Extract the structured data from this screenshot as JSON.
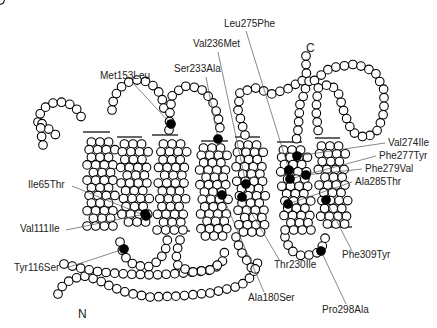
{
  "diagram": {
    "type": "receptor-snake-plot",
    "terminals": {
      "n": "N",
      "c": "C"
    },
    "colors": {
      "residue_fill": "#ffffff",
      "mutation_fill": "#000000",
      "stroke": "#000000"
    },
    "mutations": [
      {
        "id": "ile65thr",
        "label": "Ile65Thr",
        "dot": [
          146,
          216
        ],
        "text": [
          28,
          188
        ],
        "anchor": "start",
        "end": [
          72,
          186
        ]
      },
      {
        "id": "val111ile",
        "label": "Val111Ile",
        "dot": [
          145,
          214
        ],
        "text": [
          20,
          232
        ],
        "anchor": "start",
        "end": [
          66,
          230
        ]
      },
      {
        "id": "tyr116ser",
        "label": "Tyr116Ser",
        "dot": [
          124,
          249
        ],
        "text": [
          14,
          271
        ],
        "anchor": "start",
        "end": [
          66,
          268
        ]
      },
      {
        "id": "met153leu",
        "label": "Met153Leu",
        "dot": [
          171,
          124
        ],
        "text": [
          100,
          79
        ],
        "anchor": "start",
        "end": [
          132,
          82
        ]
      },
      {
        "id": "ser233ala",
        "label": "Ser233Ala",
        "dot": [
          218,
          139
        ],
        "text": [
          174,
          72
        ],
        "anchor": "start",
        "end": [
          206,
          77
        ]
      },
      {
        "id": "val236met",
        "label": "Val236Met",
        "dot": [
          246,
          184
        ],
        "text": [
          193,
          47
        ],
        "anchor": "start",
        "end": [
          218,
          52
        ]
      },
      {
        "id": "leu275phe",
        "label": "Leu275Phe",
        "dot": [
          289,
          170
        ],
        "text": [
          224,
          27
        ],
        "anchor": "start",
        "end": [
          246,
          31
        ]
      },
      {
        "id": "val274ile",
        "label": "Val274Ile",
        "dot": [
          297,
          156
        ],
        "text": [
          388,
          146
        ],
        "anchor": "start",
        "end": [
          385,
          143
        ]
      },
      {
        "id": "phe277tyr",
        "label": "Phe277Tyr",
        "dot": [
          290,
          179
        ],
        "text": [
          379,
          159
        ],
        "anchor": "start",
        "end": [
          376,
          156
        ]
      },
      {
        "id": "phe279val",
        "label": "Phe279Val",
        "dot": [
          306,
          175
        ],
        "text": [
          365,
          172
        ],
        "anchor": "start",
        "end": [
          362,
          169
        ]
      },
      {
        "id": "ala285thr",
        "label": "Ala285Thr",
        "dot": [
          288,
          204
        ],
        "text": [
          355,
          185
        ],
        "anchor": "start",
        "end": [
          352,
          182
        ]
      },
      {
        "id": "phe309tyr",
        "label": "Phe309Tyr",
        "dot": [
          326,
          200
        ],
        "text": [
          342,
          258
        ],
        "anchor": "start",
        "end": [
          352,
          251
        ]
      },
      {
        "id": "thr230ile",
        "label": "Thr230Ile",
        "dot": [
          242,
          197
        ],
        "text": [
          274,
          268
        ],
        "anchor": "start",
        "end": [
          280,
          261
        ]
      },
      {
        "id": "ala180ser",
        "label": "Ala180Ser",
        "dot": [
          222,
          195
        ],
        "text": [
          248,
          301
        ],
        "anchor": "start",
        "end": [
          264,
          292
        ]
      },
      {
        "id": "pro298ala",
        "label": "Pro298Ala",
        "dot": [
          321,
          251
        ],
        "text": [
          322,
          313
        ],
        "anchor": "start",
        "end": [
          346,
          304
        ]
      }
    ],
    "membrane_lines": [
      [
        [
          83,
          132
        ],
        [
          110,
          132
        ]
      ],
      [
        [
          117,
          137
        ],
        [
          142,
          137
        ]
      ],
      [
        [
          152,
          135
        ],
        [
          178,
          135
        ]
      ],
      [
        [
          201,
          141
        ],
        [
          228,
          141
        ]
      ],
      [
        [
          235,
          137
        ],
        [
          260,
          137
        ]
      ],
      [
        [
          277,
          142
        ],
        [
          302,
          142
        ]
      ],
      [
        [
          315,
          138
        ],
        [
          340,
          138
        ]
      ],
      [
        [
          86,
          227
        ],
        [
          110,
          227
        ]
      ],
      [
        [
          125,
          224
        ],
        [
          150,
          224
        ]
      ],
      [
        [
          165,
          231
        ],
        [
          190,
          231
        ]
      ],
      [
        [
          201,
          237
        ],
        [
          226,
          237
        ]
      ],
      [
        [
          240,
          234
        ],
        [
          265,
          234
        ]
      ],
      [
        [
          286,
          231
        ],
        [
          311,
          231
        ]
      ],
      [
        [
          327,
          227
        ],
        [
          352,
          227
        ]
      ]
    ]
  }
}
